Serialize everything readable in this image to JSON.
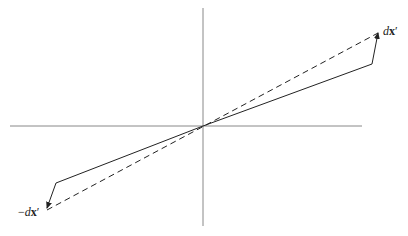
{
  "diagram": {
    "width": 408,
    "height": 236,
    "colors": {
      "axis": "#888888",
      "line": "#222222",
      "background": "#ffffff"
    },
    "origin": [
      203,
      126
    ],
    "axes": {
      "horizontal": {
        "x1": 10,
        "y": 126,
        "x2": 362
      },
      "vertical": {
        "x": 203,
        "y1": 8,
        "y2": 226
      }
    },
    "dashed_line": {
      "x1": 47,
      "y1": 210,
      "x2": 378,
      "y2": 33
    },
    "solid_paths": [
      {
        "name": "upper-vector",
        "points": [
          [
            203,
            126
          ],
          [
            372,
            64
          ],
          [
            378,
            33
          ]
        ]
      },
      {
        "name": "lower-vector",
        "points": [
          [
            203,
            126
          ],
          [
            56,
            183
          ],
          [
            47,
            208
          ]
        ]
      }
    ],
    "labels": {
      "positive": {
        "prefix": "",
        "d": "d",
        "x": "x",
        "prime": "′"
      },
      "negative": {
        "prefix": "−",
        "d": "d",
        "x": "x",
        "prime": "′"
      }
    }
  }
}
